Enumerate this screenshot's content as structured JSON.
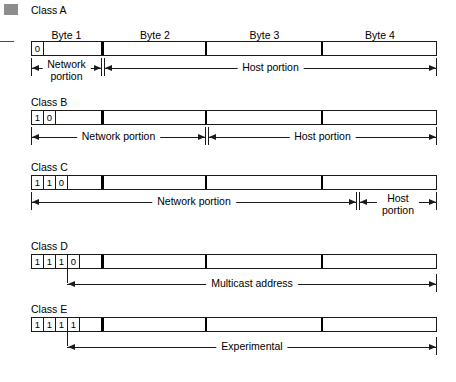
{
  "figure": {
    "bullet": "gray-square-marker",
    "bar_bits_total": 32,
    "byte_labels": [
      "Byte 1",
      "Byte 2",
      "Byte 3",
      "Byte 4"
    ]
  },
  "classes": [
    {
      "title": "Class A",
      "bits": [
        "0"
      ],
      "show_byte_labels": true,
      "spans": [
        {
          "label": "Network portion",
          "two_line": true
        },
        {
          "label": "Host portion",
          "two_line": false
        }
      ]
    },
    {
      "title": "Class B",
      "bits": [
        "1",
        "0"
      ],
      "show_byte_labels": false,
      "spans": [
        {
          "label": "Network portion",
          "two_line": false
        },
        {
          "label": "Host portion",
          "two_line": false
        }
      ]
    },
    {
      "title": "Class C",
      "bits": [
        "1",
        "1",
        "0"
      ],
      "show_byte_labels": false,
      "spans": [
        {
          "label": "Network portion",
          "two_line": false
        },
        {
          "label": "Host portion",
          "two_line": true
        }
      ]
    },
    {
      "title": "Class D",
      "bits": [
        "1",
        "1",
        "1",
        "0"
      ],
      "show_byte_labels": false,
      "spans": [
        {
          "label": "Multicast address",
          "two_line": false
        }
      ]
    },
    {
      "title": "Class E",
      "bits": [
        "1",
        "1",
        "1",
        "1"
      ],
      "show_byte_labels": false,
      "spans": [
        {
          "label": "Experimental",
          "two_line": false
        }
      ]
    }
  ]
}
